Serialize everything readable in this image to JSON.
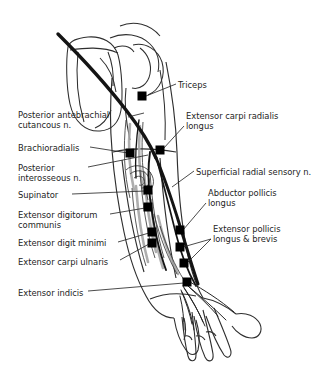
{
  "figure": {
    "background_color": "#ffffff",
    "ink_color": "#1a1a1a",
    "nerve_color": "#111111",
    "muscle_shade_color": "#9a9a9a",
    "marker_color": "#000000",
    "text_color": "#242424",
    "leader_color": "#2b2b2b",
    "width": 319,
    "height": 366
  },
  "labels_left": [
    {
      "id": "posterior-antebrachial-cutaneous-n",
      "lines": [
        "Posterior antebrachial",
        "cutancous n."
      ],
      "text_x": 18,
      "text_y": 110,
      "leader": [
        [
          128,
          117
        ],
        [
          144,
          113
        ]
      ],
      "marker": null
    },
    {
      "id": "brachioradialis",
      "lines": [
        "Brachioradialis"
      ],
      "text_x": 18,
      "text_y": 143,
      "leader": [
        [
          90,
          147
        ],
        [
          128,
          153
        ]
      ],
      "marker": [
        130,
        153
      ]
    },
    {
      "id": "posterior-interosseous-n",
      "lines": [
        "Posterior",
        "interosseous n."
      ],
      "text_x": 18,
      "text_y": 163,
      "leader": [
        [
          88,
          167
        ],
        [
          148,
          155
        ]
      ],
      "marker": null
    },
    {
      "id": "supinator",
      "lines": [
        "Supinator"
      ],
      "text_x": 18,
      "text_y": 190,
      "leader": [
        [
          72,
          194
        ],
        [
          145,
          191
        ]
      ],
      "marker": [
        148,
        190
      ]
    },
    {
      "id": "extensor-digitorum-communis",
      "lines": [
        "Extensor digitorum",
        "communis"
      ],
      "text_x": 18,
      "text_y": 210,
      "leader": [
        [
          110,
          214
        ],
        [
          145,
          208
        ]
      ],
      "marker": [
        148,
        207
      ]
    },
    {
      "id": "extensor-digit-minimi",
      "lines": [
        "Extensor digit minimi"
      ],
      "text_x": 18,
      "text_y": 238,
      "leader": [
        [
          118,
          242
        ],
        [
          149,
          233
        ]
      ],
      "marker": [
        152,
        232
      ]
    },
    {
      "id": "extensor-carpi-ulnaris",
      "lines": [
        "Extensor carpi ulnaris"
      ],
      "text_x": 18,
      "text_y": 257,
      "leader": [
        [
          120,
          260
        ],
        [
          149,
          244
        ]
      ],
      "marker": [
        152,
        243
      ]
    },
    {
      "id": "extensor-indicis",
      "lines": [
        "Extensor indicis"
      ],
      "text_x": 18,
      "text_y": 288,
      "leader": [
        [
          88,
          291
        ],
        [
          184,
          283
        ]
      ],
      "marker": [
        187,
        282
      ]
    }
  ],
  "labels_right": [
    {
      "id": "triceps",
      "lines": [
        "Triceps"
      ],
      "text_x": 178,
      "text_y": 80,
      "leader": [
        [
          176,
          84
        ],
        [
          146,
          96
        ]
      ],
      "marker": [
        142,
        96
      ]
    },
    {
      "id": "extensor-carpi-radialis-longus",
      "lines": [
        "Extensor carpi radialis",
        "longus"
      ],
      "text_x": 186,
      "text_y": 111,
      "leader": [
        [
          184,
          126
        ],
        [
          163,
          149
        ]
      ],
      "marker": [
        160,
        150
      ]
    },
    {
      "id": "superficial-radial-sensory-n",
      "lines": [
        "Superficial radial sensory n."
      ],
      "text_x": 196,
      "text_y": 167,
      "leader": [
        [
          194,
          171
        ],
        [
          172,
          187
        ]
      ],
      "marker": null
    },
    {
      "id": "abductor-pollicis-longus",
      "lines": [
        "Abductor pollicis",
        "longus"
      ],
      "text_x": 208,
      "text_y": 188,
      "leader": [
        [
          206,
          203
        ],
        [
          183,
          230
        ]
      ],
      "marker": [
        180,
        230
      ]
    },
    {
      "id": "extensor-pollicis-longus-brevis",
      "lines": [
        "Extensor pollicis",
        "longus & brevis"
      ],
      "text_x": 213,
      "text_y": 224,
      "leader": [
        [
          211,
          239
        ],
        [
          183,
          247
        ]
      ],
      "marker": [
        180,
        247
      ]
    },
    {
      "id": "extensor-pollicis-secondary-leader",
      "lines": [],
      "text_x": 0,
      "text_y": 0,
      "leader": [
        [
          211,
          239
        ],
        [
          187,
          263
        ]
      ],
      "marker": [
        184,
        263
      ]
    }
  ],
  "markers": [
    {
      "id": "marker-triceps",
      "x": 142,
      "y": 96
    },
    {
      "id": "marker-extensor-carpi-radialis-longus",
      "x": 160,
      "y": 150
    },
    {
      "id": "marker-brachioradialis",
      "x": 130,
      "y": 153
    },
    {
      "id": "marker-supinator",
      "x": 148,
      "y": 190
    },
    {
      "id": "marker-extensor-digitorum-communis",
      "x": 148,
      "y": 207
    },
    {
      "id": "marker-abductor-pollicis-longus",
      "x": 180,
      "y": 230
    },
    {
      "id": "marker-extensor-digit-minimi",
      "x": 152,
      "y": 232
    },
    {
      "id": "marker-extensor-carpi-ulnaris",
      "x": 152,
      "y": 243
    },
    {
      "id": "marker-extensor-pollicis-brevis",
      "x": 180,
      "y": 247
    },
    {
      "id": "marker-extensor-pollicis-longus",
      "x": 184,
      "y": 263
    },
    {
      "id": "marker-extensor-indicis",
      "x": 187,
      "y": 282
    }
  ],
  "marker_size": 9
}
